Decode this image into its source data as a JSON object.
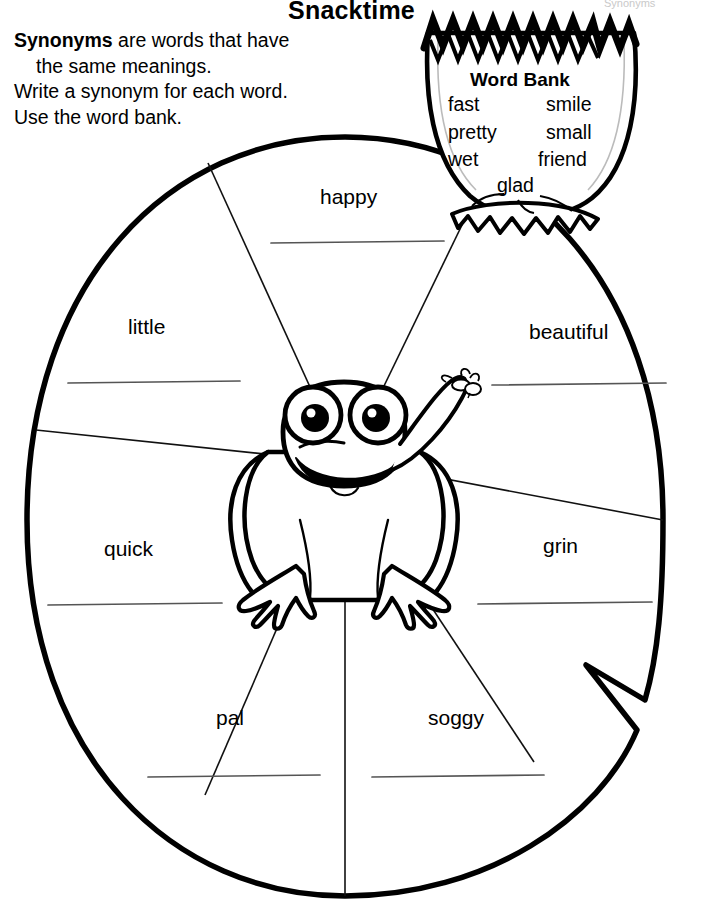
{
  "page": {
    "title": "Snacktime",
    "corner_note": "Synonyms",
    "instructions": {
      "lead_bold": "Synonyms",
      "line1_rest": " are words that have",
      "line2": "the same meanings.",
      "line3": "Write a synonym for each word.",
      "line4": "Use the word bank."
    }
  },
  "word_bank": {
    "heading": "Word Bank",
    "col1": [
      "fast",
      "pretty",
      "wet"
    ],
    "col2": [
      "smile",
      "small",
      "friend"
    ],
    "center": "glad"
  },
  "wheel": {
    "sections": [
      {
        "label": "happy",
        "answer": ""
      },
      {
        "label": "little",
        "answer": ""
      },
      {
        "label": "quick",
        "answer": ""
      },
      {
        "label": "pal",
        "answer": ""
      },
      {
        "label": "soggy",
        "answer": ""
      },
      {
        "label": "grin",
        "answer": ""
      },
      {
        "label": "beautiful",
        "answer": ""
      }
    ]
  },
  "illustration": {
    "frog": "frog-icon",
    "fly": "fly-icon",
    "lilypad": "lilypad-icon",
    "cup": "flower-cup-icon"
  },
  "colors": {
    "ink": "#000000",
    "rule": "#555555",
    "faint": "#c9c9c9"
  }
}
